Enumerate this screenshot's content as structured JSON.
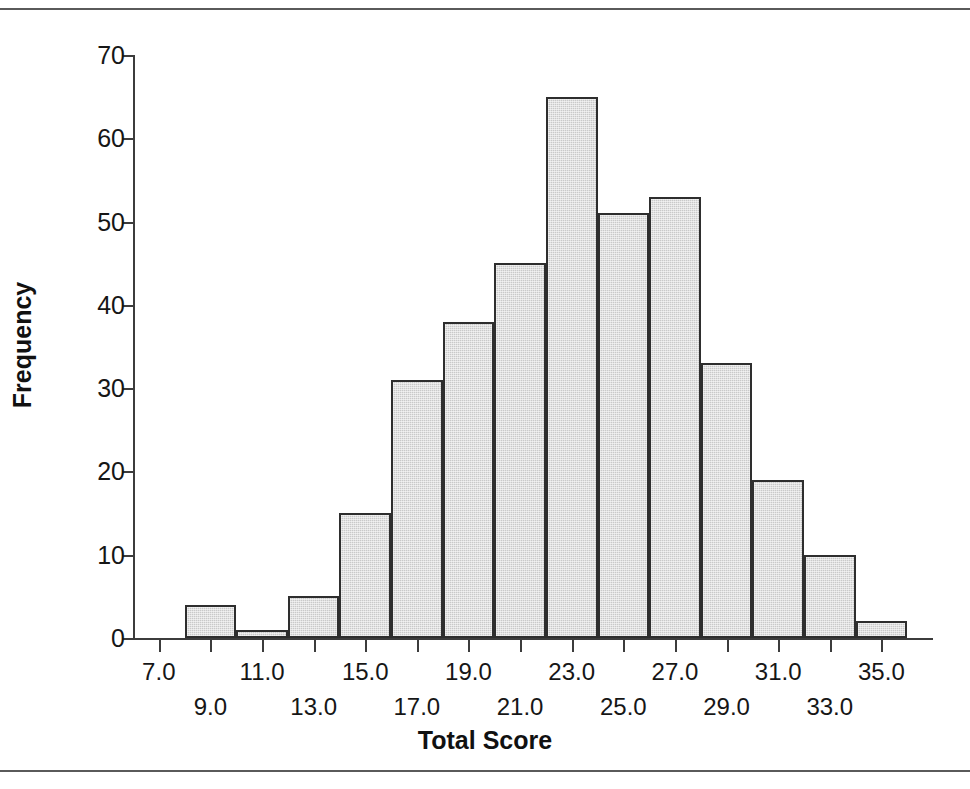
{
  "chart_data": {
    "type": "bar",
    "title": "",
    "xlabel": "Total Score",
    "ylabel": "Frequency",
    "grid": false,
    "legend": false,
    "xlim": [
      6.0,
      37.0
    ],
    "ylim": [
      0,
      70
    ],
    "bin_width": 2,
    "bin_starts": [
      6,
      8,
      10,
      12,
      14,
      16,
      18,
      20,
      22,
      24,
      26,
      28,
      30,
      32,
      34
    ],
    "bin_ends": [
      8,
      10,
      12,
      14,
      16,
      18,
      20,
      22,
      24,
      26,
      28,
      30,
      32,
      34,
      36
    ],
    "categories": [
      "6-8",
      "8-10",
      "10-12",
      "12-14",
      "14-16",
      "16-18",
      "18-20",
      "20-22",
      "22-24",
      "24-26",
      "26-28",
      "28-30",
      "30-32",
      "32-34",
      "34-36"
    ],
    "values": [
      0,
      4,
      1,
      5,
      15,
      31,
      38,
      45,
      65,
      51,
      53,
      33,
      19,
      10,
      2
    ],
    "bar_color": "#c9c9c9",
    "bar_edge_color": "#2e2e2e",
    "x_ticks": [
      7.0,
      9.0,
      11.0,
      13.0,
      15.0,
      17.0,
      19.0,
      21.0,
      23.0,
      25.0,
      27.0,
      29.0,
      31.0,
      33.0,
      35.0
    ],
    "x_tick_labels": [
      "7.0",
      "9.0",
      "11.0",
      "13.0",
      "15.0",
      "17.0",
      "19.0",
      "21.0",
      "23.0",
      "25.0",
      "27.0",
      "29.0",
      "31.0",
      "33.0",
      "35.0"
    ],
    "y_ticks": [
      0,
      10,
      20,
      30,
      40,
      50,
      60,
      70
    ],
    "y_tick_labels": [
      "0",
      "10",
      "20",
      "30",
      "40",
      "50",
      "60",
      "70"
    ]
  },
  "axes": {
    "y_title": "Frequency",
    "x_title": "Total Score"
  }
}
